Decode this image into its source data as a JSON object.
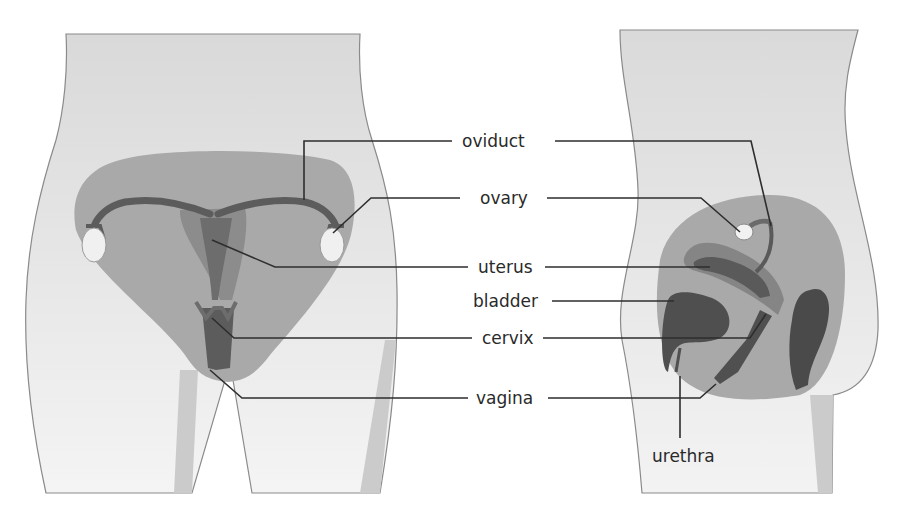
{
  "diagram": {
    "views": [
      "front-view",
      "side-view"
    ],
    "labels": {
      "oviduct": "oviduct",
      "ovary": "ovary",
      "uterus": "uterus",
      "bladder": "bladder",
      "cervix": "cervix",
      "vagina": "vagina",
      "urethra": "urethra"
    },
    "colors": {
      "skin": "#d9d9d9",
      "skin_light": "#ececec",
      "pelvis": "#a8a8a8",
      "organ_mid": "#8a8a8a",
      "organ_dark": "#555555",
      "ovary": "#f2f2f2",
      "outline": "#7a7a7a",
      "leader": "#2e2e2e"
    }
  }
}
